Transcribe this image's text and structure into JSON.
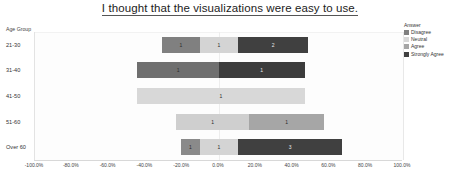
{
  "chart_data": {
    "type": "bar",
    "title": "I thought that the visualizations were easy to use.",
    "orientation": "horizontal",
    "stacked": "diverging",
    "xlabel": "",
    "ylabel": "Age Group",
    "xlim": [
      -100,
      100
    ],
    "grid": false,
    "legend_position": "right",
    "legend_title": "Answer",
    "categories": [
      "21-30",
      "31-40",
      "41-50",
      "51-60",
      "Over 60"
    ],
    "series": [
      {
        "name": "Disagree",
        "color": "#808080",
        "values": [
          1,
          0,
          0,
          0,
          1
        ]
      },
      {
        "name": "Neutral",
        "color": "#d4d4d4",
        "values": [
          1,
          0,
          1,
          1,
          1
        ]
      },
      {
        "name": "Agree",
        "color": "#a6a6a6",
        "values": [
          0,
          1,
          0,
          1,
          0
        ]
      },
      {
        "name": "Strongly Agree",
        "color": "#404040",
        "values": [
          2,
          1,
          0,
          0,
          3
        ]
      }
    ],
    "xticks": [
      "-100.0%",
      "-80.0%",
      "-60.0%",
      "-40.0%",
      "-20.0%",
      "0.0%",
      "20.0%",
      "40.0%",
      "60.0%",
      "80.0%",
      "100.0%"
    ],
    "xtick_values": [
      -100,
      -80,
      -60,
      -40,
      -20,
      0,
      20,
      40,
      60,
      80,
      100
    ],
    "rows": [
      {
        "category": "21-30",
        "segments": [
          {
            "series": "Disagree",
            "label": "1",
            "start": -31.0,
            "end": -10.5,
            "color": "#808080",
            "dark": false
          },
          {
            "series": "Neutral",
            "label": "1",
            "start": -10.5,
            "end": 10.5,
            "color": "#d4d4d4",
            "dark": false
          },
          {
            "series": "Strongly Agree",
            "label": "2",
            "start": 10.5,
            "end": 48.5,
            "color": "#404040",
            "dark": true
          }
        ]
      },
      {
        "category": "31-40",
        "segments": [
          {
            "series": "Agree",
            "label": "1",
            "start": -44.5,
            "end": 0.0,
            "color": "#6f6f6f",
            "dark": false
          },
          {
            "series": "Strongly Agree",
            "label": "1",
            "start": 0.0,
            "end": 46.5,
            "color": "#3c3c3c",
            "dark": true
          }
        ]
      },
      {
        "category": "41-50",
        "segments": [
          {
            "series": "Neutral",
            "label": "1",
            "start": -44.5,
            "end": 46.5,
            "color": "#d8d8d8",
            "dark": false
          }
        ]
      },
      {
        "category": "51-60",
        "segments": [
          {
            "series": "Neutral",
            "label": "1",
            "start": -23.5,
            "end": 16.5,
            "color": "#cfcfcf",
            "dark": false
          },
          {
            "series": "Agree",
            "label": "1",
            "start": 16.5,
            "end": 57.0,
            "color": "#a6a6a6",
            "dark": false
          }
        ]
      },
      {
        "category": "Over 60",
        "segments": [
          {
            "series": "Disagree",
            "label": "1",
            "start": -20.5,
            "end": -10.5,
            "color": "#8a8a8a",
            "dark": false
          },
          {
            "series": "Neutral",
            "label": "1",
            "start": -10.5,
            "end": 10.5,
            "color": "#d4d4d4",
            "dark": false
          },
          {
            "series": "Strongly Agree",
            "label": "3",
            "start": 10.5,
            "end": 67.0,
            "color": "#404040",
            "dark": true
          }
        ]
      }
    ]
  },
  "legend": {
    "title": "Answer",
    "items": [
      {
        "label": "Disagree",
        "color": "#808080"
      },
      {
        "label": "Neutral",
        "color": "#d8d8d8"
      },
      {
        "label": "Agree",
        "color": "#a6a6a6"
      },
      {
        "label": "Strongly Agree",
        "color": "#404040"
      }
    ]
  },
  "axis": {
    "y_caption": "Age Group"
  }
}
